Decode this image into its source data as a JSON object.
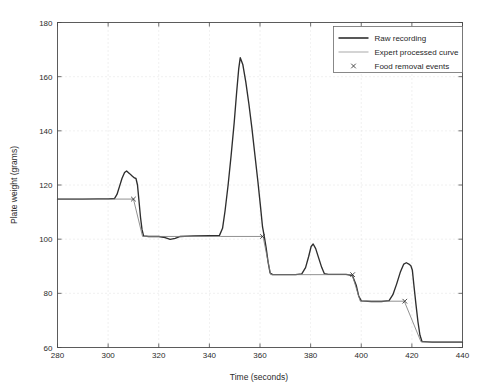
{
  "chart_data": {
    "type": "line",
    "title": "",
    "xlabel": "Time (seconds)",
    "ylabel": "Plate weight (grams)",
    "xlim": [
      280,
      440
    ],
    "ylim": [
      60,
      180
    ],
    "xticks": [
      280,
      300,
      320,
      340,
      360,
      380,
      400,
      420,
      440
    ],
    "yticks": [
      60,
      80,
      100,
      120,
      140,
      160,
      180
    ],
    "grid": "dotted-faint",
    "legend_position": "top-right",
    "series": [
      {
        "name": "Raw recording",
        "color": "#2e2e2e",
        "style": "solid-thick",
        "points": [
          [
            280.0,
            114.8
          ],
          [
            290.0,
            114.8
          ],
          [
            296.0,
            114.9
          ],
          [
            300.0,
            114.9
          ],
          [
            302.5,
            115.0
          ],
          [
            303.5,
            116.5
          ],
          [
            304.5,
            119.5
          ],
          [
            305.5,
            122.5
          ],
          [
            306.5,
            124.6
          ],
          [
            307.3,
            125.2
          ],
          [
            308.5,
            124.2
          ],
          [
            309.6,
            123.2
          ],
          [
            310.4,
            122.6
          ],
          [
            311.0,
            122.4
          ],
          [
            311.6,
            120.0
          ],
          [
            312.2,
            114.0
          ],
          [
            312.8,
            108.0
          ],
          [
            313.4,
            103.5
          ],
          [
            314.0,
            101.2
          ],
          [
            316.0,
            101.0
          ],
          [
            320.0,
            101.0
          ],
          [
            322.5,
            100.6
          ],
          [
            324.5,
            99.9
          ],
          [
            326.5,
            100.3
          ],
          [
            328.5,
            101.0
          ],
          [
            334.0,
            101.2
          ],
          [
            340.0,
            101.3
          ],
          [
            344.0,
            101.4
          ],
          [
            345.2,
            104.0
          ],
          [
            346.2,
            110.5
          ],
          [
            347.4,
            120.0
          ],
          [
            348.6,
            131.0
          ],
          [
            349.8,
            143.0
          ],
          [
            350.8,
            154.5
          ],
          [
            351.6,
            163.0
          ],
          [
            352.2,
            167.0
          ],
          [
            353.2,
            164.5
          ],
          [
            354.4,
            158.0
          ],
          [
            355.6,
            150.0
          ],
          [
            356.8,
            141.0
          ],
          [
            358.0,
            131.0
          ],
          [
            359.2,
            121.0
          ],
          [
            360.2,
            112.0
          ],
          [
            361.0,
            104.5
          ],
          [
            361.6,
            101.5
          ],
          [
            362.4,
            97.0
          ],
          [
            363.2,
            91.5
          ],
          [
            364.0,
            87.5
          ],
          [
            365.0,
            86.9
          ],
          [
            370.0,
            86.9
          ],
          [
            374.0,
            86.9
          ],
          [
            376.5,
            87.2
          ],
          [
            378.0,
            89.5
          ],
          [
            379.2,
            93.5
          ],
          [
            380.2,
            97.3
          ],
          [
            381.0,
            98.2
          ],
          [
            382.0,
            96.5
          ],
          [
            383.2,
            93.0
          ],
          [
            384.4,
            89.5
          ],
          [
            385.4,
            87.3
          ],
          [
            387.0,
            87.0
          ],
          [
            390.0,
            87.0
          ],
          [
            394.0,
            87.0
          ],
          [
            396.5,
            86.6
          ],
          [
            398.0,
            83.0
          ],
          [
            399.0,
            79.0
          ],
          [
            400.0,
            77.2
          ],
          [
            404.0,
            77.0
          ],
          [
            408.0,
            77.0
          ],
          [
            411.0,
            77.3
          ],
          [
            412.5,
            79.5
          ],
          [
            414.0,
            83.5
          ],
          [
            415.5,
            88.0
          ],
          [
            416.8,
            90.8
          ],
          [
            417.8,
            91.3
          ],
          [
            418.8,
            90.8
          ],
          [
            419.6,
            90.2
          ],
          [
            420.2,
            88.5
          ],
          [
            420.8,
            83.0
          ],
          [
            421.6,
            76.0
          ],
          [
            422.4,
            69.5
          ],
          [
            423.2,
            64.5
          ],
          [
            424.0,
            62.2
          ],
          [
            428.0,
            62.0
          ],
          [
            434.0,
            62.0
          ],
          [
            440.0,
            62.0
          ]
        ]
      },
      {
        "name": "Expert processed curve",
        "color": "#7d7d7d",
        "style": "solid-thin",
        "points": [
          [
            280.0,
            114.8
          ],
          [
            309.8,
            114.8
          ],
          [
            310.0,
            114.8
          ],
          [
            313.6,
            101.0
          ],
          [
            344.5,
            101.0
          ],
          [
            361.2,
            101.0
          ],
          [
            364.2,
            86.9
          ],
          [
            396.4,
            86.9
          ],
          [
            399.6,
            77.1
          ],
          [
            417.0,
            77.1
          ],
          [
            423.6,
            62.1
          ],
          [
            440.0,
            62.1
          ]
        ]
      }
    ],
    "event_markers": {
      "name": "Food removal events",
      "symbol": "x",
      "color": "#3a3a3a",
      "points": [
        [
          310.0,
          114.8
        ],
        [
          361.0,
          101.0
        ],
        [
          396.6,
          86.9
        ],
        [
          417.2,
          77.1
        ]
      ]
    },
    "legend_entries": [
      {
        "label": "Raw recording",
        "type": "line-thick"
      },
      {
        "label": "Expert processed curve",
        "type": "line-thin"
      },
      {
        "label": "Food removal events",
        "type": "marker-x"
      }
    ]
  }
}
